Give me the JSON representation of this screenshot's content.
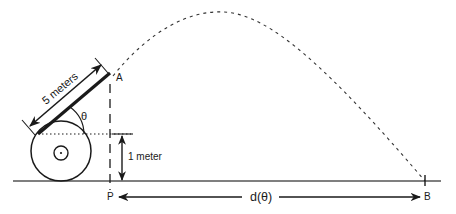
{
  "diagram": {
    "labels": {
      "barrel_length": "5 meters",
      "height": "1 meter",
      "angle": "θ",
      "launch_point": "A",
      "base_point": "P",
      "landing_point": "B",
      "distance": "d(θ)"
    },
    "quantities": {
      "barrel_length_m": 5,
      "pivot_height_m": 1
    },
    "colors": {
      "ink": "#1a1a1a",
      "background": "#ffffff"
    }
  }
}
